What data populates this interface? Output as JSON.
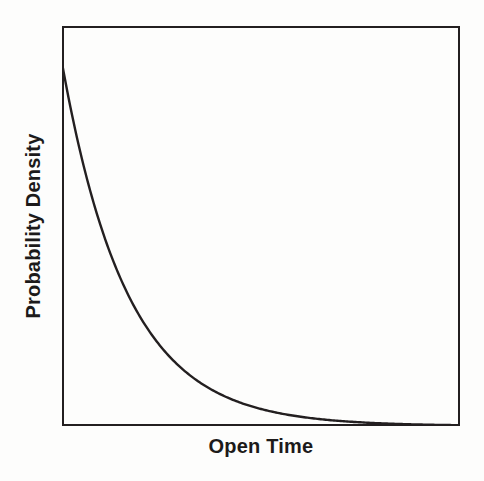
{
  "figure": {
    "background_color": "#fdfdfc",
    "width": 484,
    "height": 481
  },
  "axes": {
    "frame_color": "#231f20",
    "frame_line_width": 2.5,
    "x_label": "Open Time",
    "y_label": "Probability Density",
    "tick_labels_shown": false,
    "grid_shown": false,
    "tick_marks_shown": false
  },
  "chart_data": {
    "type": "line",
    "title": "",
    "subtitle": "",
    "xlabel": "Open Time",
    "ylabel": "Probability Density",
    "xlim": [
      0,
      1
    ],
    "ylim": [
      0,
      1
    ],
    "grid": false,
    "legend": null,
    "legend_position": "none",
    "annotations": [],
    "x_tick_labels": [],
    "y_tick_labels": [],
    "series": [
      {
        "name": "Exponential probability density of channel open time",
        "color": "#231f20",
        "line_width": 2.4,
        "description": "Single-exponential decay: density is maximal at the shortest open times and falls monotonically, approaching zero asymptotically along the x-axis.",
        "model": "y = y0 * exp(-x / tau)",
        "y0": 0.9075,
        "tau": 0.1633,
        "x": [
          0.0,
          0.02,
          0.04,
          0.06,
          0.08,
          0.1,
          0.12,
          0.14,
          0.16,
          0.18,
          0.2,
          0.24,
          0.28,
          0.32,
          0.36,
          0.4,
          0.45,
          0.5,
          0.55,
          0.6,
          0.65,
          0.7,
          0.75,
          0.8,
          0.85,
          0.9,
          0.95,
          1.0
        ],
        "y": [
          0.9075,
          0.8028,
          0.7102,
          0.6283,
          0.5558,
          0.4917,
          0.435,
          0.3848,
          0.3404,
          0.3011,
          0.2664,
          0.2085,
          0.1632,
          0.1277,
          0.1,
          0.0782,
          0.0577,
          0.0426,
          0.0314,
          0.0232,
          0.0171,
          0.0126,
          0.0093,
          0.0069,
          0.0051,
          0.0037,
          0.0028,
          0.002
        ]
      }
    ]
  }
}
